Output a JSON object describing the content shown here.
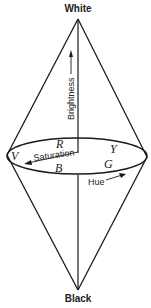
{
  "diagram": {
    "top_label": "White",
    "bottom_label": "Black",
    "axis_label": "Brightness",
    "radial_label": "Saturation",
    "circular_label": "Hue",
    "hue_letters": {
      "red": "R",
      "yellow": "Y",
      "green": "G",
      "blue": "B",
      "violet": "V"
    },
    "colors": {
      "line": "#1a1a1a",
      "background": "#ffffff"
    }
  }
}
